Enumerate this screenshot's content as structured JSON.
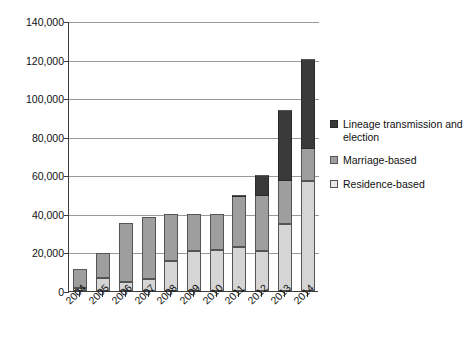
{
  "chart_data": {
    "type": "bar",
    "stacked": true,
    "title": "",
    "subtitle": "",
    "xlabel": "",
    "ylabel": "",
    "ylim": [
      0,
      140000
    ],
    "ytick_values": [
      0,
      20000,
      40000,
      60000,
      80000,
      100000,
      120000,
      140000
    ],
    "ytick_labels": [
      "0",
      "20,000",
      "40,000",
      "60,000",
      "80,000",
      "100,000",
      "120,000",
      "140,000"
    ],
    "grid": true,
    "legend_position": "right",
    "categories": [
      "2004",
      "2005",
      "2006",
      "2007",
      "2008",
      "2009",
      "2010",
      "2011",
      "2012",
      "2013",
      "2014"
    ],
    "series": [
      {
        "name": "Residence-based",
        "color": "#d5d5d5",
        "values": [
          1500,
          7000,
          4500,
          6000,
          15500,
          21000,
          21500,
          23000,
          21000,
          34500,
          57000
        ]
      },
      {
        "name": "Marriage-based",
        "color": "#9e9e9e",
        "values": [
          10000,
          12500,
          31000,
          32500,
          24500,
          19000,
          18500,
          25500,
          28500,
          22500,
          16500
        ]
      },
      {
        "name": "Lineage transmission and election",
        "color": "#3a3a3a",
        "values": [
          0,
          0,
          0,
          0,
          0,
          0,
          0,
          1500,
          10500,
          37000,
          47000
        ]
      }
    ],
    "totals": [
      11500,
      19500,
      35500,
      38500,
      40000,
      40000,
      40000,
      50000,
      60000,
      94000,
      120500
    ]
  },
  "legend": {
    "items": [
      {
        "label": "Lineage transmission and election",
        "swatch": "lineage-swatch"
      },
      {
        "label": "Marriage-based",
        "swatch": "marriage-swatch"
      },
      {
        "label": "Residence-based",
        "swatch": "residence-swatch"
      }
    ]
  }
}
